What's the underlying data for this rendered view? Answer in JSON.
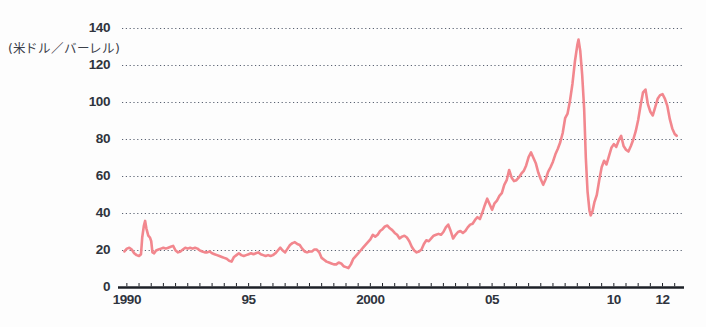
{
  "chart_data": {
    "type": "line",
    "title": "",
    "subtitle": "",
    "xlabel": "",
    "ylabel": "(米ドル／バーレル)",
    "ylabel_meaning": "US dollars per barrel",
    "ylim": [
      0,
      140
    ],
    "ytick_labels": [
      "0",
      "20",
      "40",
      "60",
      "80",
      "100",
      "120",
      "140"
    ],
    "ytick_values": [
      0,
      20,
      40,
      60,
      80,
      100,
      120,
      140
    ],
    "xlim": [
      1989.8,
      2012.8
    ],
    "xtick_labels": [
      "1990",
      "95",
      "2000",
      "05",
      "10",
      "12"
    ],
    "xtick_values": [
      1990,
      1995,
      2000,
      2005,
      2010,
      2012
    ],
    "minor_tick_interval": 0.5,
    "grid": "horizontal-dotted",
    "legend": "none",
    "series": [
      {
        "name": "crude-oil-price",
        "color": "#f2878e",
        "x": [
          1989.9,
          1990.0,
          1990.1,
          1990.2,
          1990.3,
          1990.4,
          1990.5,
          1990.58,
          1990.63,
          1990.7,
          1990.75,
          1990.8,
          1990.88,
          1990.95,
          1991.0,
          1991.05,
          1991.12,
          1991.2,
          1991.3,
          1991.4,
          1991.5,
          1991.6,
          1991.7,
          1991.8,
          1991.9,
          1992.0,
          1992.1,
          1992.2,
          1992.3,
          1992.4,
          1992.5,
          1992.6,
          1992.7,
          1992.8,
          1992.9,
          1993.0,
          1993.1,
          1993.2,
          1993.3,
          1993.4,
          1993.5,
          1993.6,
          1993.7,
          1993.8,
          1993.9,
          1994.0,
          1994.1,
          1994.2,
          1994.3,
          1994.4,
          1994.5,
          1994.6,
          1994.7,
          1994.8,
          1994.9,
          1995.0,
          1995.1,
          1995.2,
          1995.3,
          1995.4,
          1995.5,
          1995.6,
          1995.7,
          1995.8,
          1995.9,
          1996.0,
          1996.1,
          1996.2,
          1996.3,
          1996.4,
          1996.5,
          1996.6,
          1996.7,
          1996.8,
          1996.9,
          1997.0,
          1997.1,
          1997.2,
          1997.3,
          1997.4,
          1997.5,
          1997.6,
          1997.7,
          1997.8,
          1997.9,
          1998.0,
          1998.1,
          1998.2,
          1998.3,
          1998.4,
          1998.5,
          1998.6,
          1998.7,
          1998.8,
          1998.9,
          1999.0,
          1999.1,
          1999.2,
          1999.3,
          1999.4,
          1999.5,
          1999.6,
          1999.7,
          1999.8,
          1999.9,
          2000.0,
          2000.1,
          2000.2,
          2000.3,
          2000.4,
          2000.5,
          2000.6,
          2000.7,
          2000.8,
          2000.9,
          2001.0,
          2001.1,
          2001.2,
          2001.3,
          2001.4,
          2001.5,
          2001.6,
          2001.7,
          2001.8,
          2001.9,
          2002.0,
          2002.1,
          2002.2,
          2002.3,
          2002.4,
          2002.5,
          2002.6,
          2002.7,
          2002.8,
          2002.9,
          2003.0,
          2003.1,
          2003.2,
          2003.3,
          2003.4,
          2003.5,
          2003.6,
          2003.7,
          2003.8,
          2003.9,
          2004.0,
          2004.1,
          2004.2,
          2004.3,
          2004.4,
          2004.5,
          2004.6,
          2004.7,
          2004.8,
          2004.9,
          2005.0,
          2005.1,
          2005.2,
          2005.3,
          2005.4,
          2005.5,
          2005.6,
          2005.7,
          2005.8,
          2005.9,
          2006.0,
          2006.1,
          2006.2,
          2006.3,
          2006.4,
          2006.5,
          2006.6,
          2006.7,
          2006.8,
          2006.9,
          2007.0,
          2007.1,
          2007.2,
          2007.3,
          2007.4,
          2007.5,
          2007.6,
          2007.7,
          2007.8,
          2007.9,
          2008.0,
          2008.1,
          2008.2,
          2008.3,
          2008.4,
          2008.5,
          2008.55,
          2008.62,
          2008.7,
          2008.78,
          2008.85,
          2008.92,
          2009.0,
          2009.05,
          2009.12,
          2009.2,
          2009.3,
          2009.4,
          2009.5,
          2009.6,
          2009.7,
          2009.8,
          2009.9,
          2010.0,
          2010.1,
          2010.2,
          2010.3,
          2010.4,
          2010.5,
          2010.6,
          2010.7,
          2010.8,
          2010.9,
          2011.0,
          2011.1,
          2011.2,
          2011.3,
          2011.4,
          2011.5,
          2011.6,
          2011.7,
          2011.8,
          2011.9,
          2012.0,
          2012.1,
          2012.2,
          2012.3,
          2012.4,
          2012.5,
          2012.58
        ],
        "y": [
          19.5,
          21.0,
          21.5,
          20.5,
          18.5,
          17.5,
          17.0,
          18.0,
          27.0,
          33.5,
          36.0,
          32.0,
          28.0,
          27.0,
          25.0,
          19.0,
          18.5,
          20.0,
          20.5,
          21.0,
          21.5,
          21.0,
          21.5,
          22.0,
          22.5,
          20.0,
          19.0,
          19.5,
          20.5,
          21.5,
          21.0,
          21.5,
          21.0,
          21.5,
          21.0,
          20.0,
          19.5,
          19.0,
          19.0,
          19.5,
          18.5,
          18.0,
          17.5,
          17.0,
          16.5,
          16.0,
          15.5,
          14.5,
          14.0,
          16.5,
          17.5,
          18.5,
          17.5,
          17.0,
          17.5,
          18.0,
          18.5,
          18.0,
          18.5,
          19.0,
          18.0,
          17.5,
          17.0,
          17.5,
          17.0,
          17.5,
          18.5,
          20.0,
          21.5,
          20.0,
          19.0,
          21.0,
          23.0,
          24.0,
          24.5,
          23.5,
          23.0,
          21.0,
          19.5,
          19.0,
          19.5,
          19.5,
          20.5,
          20.5,
          19.0,
          16.0,
          15.0,
          14.0,
          13.5,
          13.0,
          12.5,
          12.5,
          13.5,
          13.0,
          11.5,
          11.0,
          10.5,
          12.5,
          15.5,
          17.0,
          18.5,
          20.0,
          21.5,
          23.0,
          24.5,
          26.0,
          28.5,
          27.5,
          28.5,
          30.5,
          31.5,
          33.0,
          33.5,
          32.0,
          31.0,
          29.5,
          28.5,
          26.5,
          27.5,
          28.0,
          27.0,
          25.0,
          22.0,
          20.0,
          19.0,
          19.5,
          20.5,
          23.5,
          25.5,
          25.0,
          26.5,
          28.0,
          28.5,
          29.0,
          28.5,
          30.0,
          32.5,
          34.0,
          30.5,
          26.5,
          28.5,
          30.0,
          30.5,
          29.5,
          30.5,
          32.5,
          34.0,
          34.5,
          36.5,
          38.0,
          37.0,
          40.5,
          44.5,
          48.0,
          45.0,
          42.0,
          45.5,
          47.0,
          49.5,
          51.0,
          55.5,
          58.0,
          63.5,
          59.5,
          57.5,
          58.0,
          59.5,
          61.5,
          63.0,
          66.0,
          70.5,
          73.0,
          70.0,
          67.0,
          62.0,
          58.5,
          55.5,
          58.5,
          62.5,
          65.0,
          68.0,
          72.0,
          75.0,
          78.5,
          83.5,
          91.5,
          94.0,
          101.0,
          110.0,
          122.0,
          131.0,
          134.0,
          128.0,
          115.0,
          97.0,
          70.0,
          52.0,
          41.5,
          39.0,
          41.0,
          46.0,
          50.0,
          58.0,
          65.0,
          68.5,
          66.5,
          71.0,
          75.5,
          77.5,
          76.0,
          79.5,
          82.0,
          76.5,
          74.5,
          73.5,
          76.5,
          80.0,
          84.5,
          90.5,
          98.5,
          105.5,
          107.0,
          99.0,
          95.0,
          93.0,
          97.5,
          102.0,
          104.0,
          104.5,
          102.0,
          98.0,
          91.0,
          86.0,
          83.0,
          82.0
        ]
      }
    ],
    "annotations": [
      {
        "label": "Gulf War spike",
        "x": 1990.75,
        "y": 36.0
      },
      {
        "label": "1998 trough",
        "x": 1999.0,
        "y": 10.5
      },
      {
        "label": "2008 peak",
        "x": 2008.55,
        "y": 134.0
      },
      {
        "label": "2008 crash low",
        "x": 2009.05,
        "y": 39.0
      },
      {
        "label": "2011 high",
        "x": 2011.5,
        "y": 107.0
      },
      {
        "label": "series end",
        "x": 2012.58,
        "y": 82.0
      }
    ]
  },
  "axes": {
    "unit_label": "(米ドル／バーレル)",
    "y_labels": [
      "140",
      "120",
      "100",
      "80",
      "60",
      "40",
      "20",
      "0"
    ],
    "x_labels": [
      "1990",
      "95",
      "2000",
      "05",
      "10",
      "12"
    ]
  },
  "colors": {
    "line": "#f2878e",
    "grid": "#5a6272",
    "axis": "#1d2027",
    "text": "#2f343d",
    "background": "#fdfdfd"
  }
}
